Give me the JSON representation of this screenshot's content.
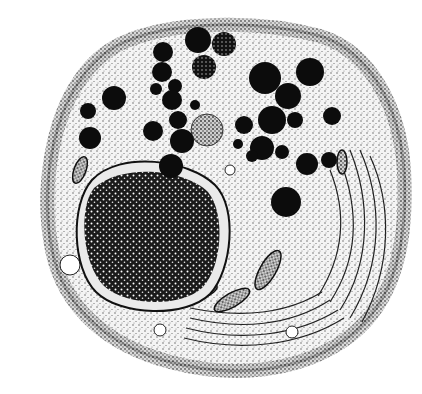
{
  "image": {
    "subject": "cell-illustration",
    "style": "black-and-white stipple drawing",
    "background": "#ffffff",
    "ink": "#111111",
    "width": 422,
    "height": 394
  },
  "granules": [
    {
      "cx": 198,
      "cy": 40,
      "r": 13
    },
    {
      "cx": 163,
      "cy": 52,
      "r": 10
    },
    {
      "cx": 224,
      "cy": 44,
      "r": 12,
      "textured": true
    },
    {
      "cx": 204,
      "cy": 67,
      "r": 12,
      "textured": true
    },
    {
      "cx": 162,
      "cy": 72,
      "r": 10
    },
    {
      "cx": 175,
      "cy": 86,
      "r": 7
    },
    {
      "cx": 156,
      "cy": 89,
      "r": 6
    },
    {
      "cx": 114,
      "cy": 98,
      "r": 12
    },
    {
      "cx": 88,
      "cy": 111,
      "r": 8
    },
    {
      "cx": 172,
      "cy": 100,
      "r": 10
    },
    {
      "cx": 178,
      "cy": 120,
      "r": 9
    },
    {
      "cx": 153,
      "cy": 131,
      "r": 10
    },
    {
      "cx": 182,
      "cy": 141,
      "r": 12
    },
    {
      "cx": 171,
      "cy": 166,
      "r": 12
    },
    {
      "cx": 90,
      "cy": 138,
      "r": 11
    },
    {
      "cx": 195,
      "cy": 105,
      "r": 5
    },
    {
      "cx": 265,
      "cy": 78,
      "r": 16
    },
    {
      "cx": 310,
      "cy": 72,
      "r": 14
    },
    {
      "cx": 288,
      "cy": 96,
      "r": 13
    },
    {
      "cx": 272,
      "cy": 120,
      "r": 14
    },
    {
      "cx": 295,
      "cy": 120,
      "r": 8
    },
    {
      "cx": 244,
      "cy": 125,
      "r": 9
    },
    {
      "cx": 238,
      "cy": 144,
      "r": 5
    },
    {
      "cx": 262,
      "cy": 148,
      "r": 12
    },
    {
      "cx": 282,
      "cy": 152,
      "r": 7
    },
    {
      "cx": 307,
      "cy": 164,
      "r": 11
    },
    {
      "cx": 329,
      "cy": 160,
      "r": 8
    },
    {
      "cx": 332,
      "cy": 116,
      "r": 9
    },
    {
      "cx": 286,
      "cy": 202,
      "r": 15
    },
    {
      "cx": 252,
      "cy": 156,
      "r": 6
    },
    {
      "cx": 178,
      "cy": 140,
      "r": 6
    }
  ],
  "vacuole": {
    "cx": 207,
    "cy": 130,
    "r": 16
  },
  "nucleus": {
    "cx": 148,
    "cy": 233,
    "rx": 82,
    "ry": 68
  }
}
